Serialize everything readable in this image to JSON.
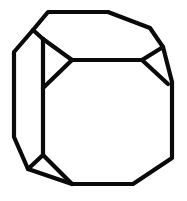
{
  "figure": {
    "background_color": "#ffffff",
    "stroke_color": "#0a0a0a",
    "stroke_width": 4.2,
    "width": 187,
    "height": 201,
    "shapes": {
      "outer_outline": {
        "name": "outer-outline",
        "closed": true,
        "points": "48,12 108,12 150,28 163,47 172,82 172,158 133,184 72,184 28,169 14,137 14,52 33,30"
      },
      "front_top_edge": {
        "name": "front-top-edge",
        "closed": false,
        "points": "72,60 142,60"
      },
      "front_left_edge": {
        "name": "front-left-edge",
        "closed": false,
        "points": "43,39 43,155"
      },
      "left_bevel_upper": {
        "name": "left-bevel-upper",
        "closed": false,
        "points": "33,30 43,39"
      },
      "left_triangle_upper": {
        "name": "left-triangle-upper-edge",
        "closed": false,
        "points": "43,39 72,60"
      },
      "left_triangle_lower": {
        "name": "left-triangle-lower-edge",
        "closed": false,
        "points": "72,60 43,88"
      },
      "right_triangle_upper": {
        "name": "right-triangle-upper-edge",
        "closed": false,
        "points": "142,60 163,47"
      },
      "right_triangle_lower": {
        "name": "right-triangle-lower-edge",
        "closed": false,
        "points": "142,60 168,84"
      },
      "bottom_triangle_left": {
        "name": "bottom-triangle-left-edge",
        "closed": false,
        "points": "43,155 28,169"
      },
      "bottom_triangle_right": {
        "name": "bottom-triangle-right-edge",
        "closed": false,
        "points": "43,155 72,184"
      },
      "bottom_right_bevel": {
        "name": "bottom-right-bevel-edge",
        "closed": false,
        "points": "133,184 172,158"
      }
    }
  }
}
